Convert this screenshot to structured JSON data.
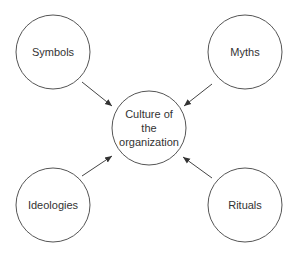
{
  "diagram": {
    "center": {
      "id": "culture",
      "lines": [
        "Culture of",
        "the",
        "organization"
      ]
    },
    "nodes": [
      {
        "id": "symbols",
        "label": "Symbols"
      },
      {
        "id": "myths",
        "label": "Myths"
      },
      {
        "id": "ideologies",
        "label": "Ideologies"
      },
      {
        "id": "rituals",
        "label": "Rituals"
      }
    ],
    "edges": [
      {
        "from": "symbols",
        "to": "culture"
      },
      {
        "from": "myths",
        "to": "culture"
      },
      {
        "from": "ideologies",
        "to": "culture"
      },
      {
        "from": "rituals",
        "to": "culture"
      }
    ],
    "colors": {
      "stroke": "#555555",
      "text": "#333333",
      "background": "#ffffff"
    }
  }
}
